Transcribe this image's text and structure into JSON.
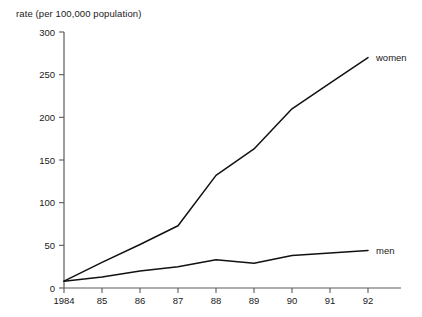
{
  "chart_data": {
    "type": "line",
    "title": "rate (per 100,000 population)",
    "xlabel": "",
    "ylabel": "rate (per 100,000 population)",
    "categories": [
      "1984",
      "85",
      "86",
      "87",
      "88",
      "89",
      "90",
      "91",
      "92"
    ],
    "x": [
      1984,
      1985,
      1986,
      1987,
      1988,
      1989,
      1990,
      1991,
      1992
    ],
    "series": [
      {
        "name": "women",
        "values": [
          8,
          30,
          51,
          73,
          132,
          163,
          210,
          240,
          270
        ]
      },
      {
        "name": "men",
        "values": [
          8,
          13,
          20,
          25,
          33,
          29,
          38,
          41,
          44
        ]
      }
    ],
    "ylim": [
      0,
      300
    ],
    "yticks": [
      0,
      50,
      100,
      150,
      200,
      250,
      300
    ],
    "ytick_labels": [
      "0",
      "50",
      "100",
      "150",
      "200",
      "250",
      "300"
    ],
    "grid": false,
    "legend_position": "inline-right",
    "annotations": [
      {
        "text": "women",
        "series": "women",
        "at": "1992"
      },
      {
        "text": "men",
        "series": "men",
        "at": "1992"
      }
    ],
    "line_color": "#111111",
    "axis_color": "#5a5a5a"
  },
  "labels": {
    "y_axis_caption": "rate (per 100,000 population)",
    "series_women": "women",
    "series_men": "men"
  }
}
